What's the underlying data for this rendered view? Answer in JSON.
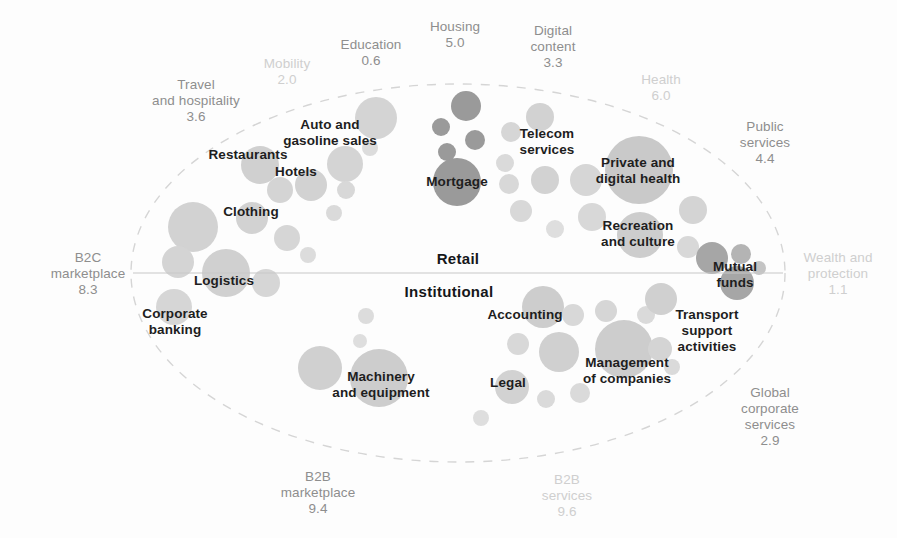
{
  "figure": {
    "type": "bubble-map",
    "background_color": "#fdfdfd",
    "divider_label_top": "Retail",
    "divider_label_bottom": "Institutional"
  },
  "axis_labels": {
    "retail": "Retail",
    "institutional": "Institutional"
  },
  "colors": {
    "bubble_light": "#d9d9d9",
    "bubble_mid": "#c9c9c9",
    "bubble_dark": "#9a9a9a",
    "outer_label": "#8e8e8e",
    "outer_label_faint": "#cfcfcf",
    "bubble_label": "#1e1e1e",
    "divider_line": "#c8c8c8",
    "ellipse_dash": "#d5d5d5"
  },
  "chart_data": {
    "type": "scatter",
    "title": "",
    "xlabel": "",
    "ylabel": "",
    "grid": false,
    "legend": "none",
    "divider": {
      "orientation": "horizontal",
      "y": 273,
      "x_start": 133,
      "x_end": 783,
      "above_label": "Retail",
      "below_label": "Institutional"
    },
    "boundary": {
      "shape": "ellipse",
      "cx": 458,
      "cy": 273,
      "rx": 327,
      "ry": 189,
      "style": "dashed"
    },
    "outer_labels": [
      {
        "name": "outer-label-mobility",
        "text": "Mobility",
        "value": "2.0",
        "x": 287,
        "y": 72,
        "faint": true
      },
      {
        "name": "outer-label-education",
        "text": "Education",
        "value": "0.6",
        "x": 371,
        "y": 53,
        "faint": false
      },
      {
        "name": "outer-label-housing",
        "text": "Housing",
        "value": "5.0",
        "x": 455,
        "y": 35,
        "faint": false
      },
      {
        "name": "outer-label-digital-content",
        "text": "Digital\ncontent",
        "value": "3.3",
        "x": 553,
        "y": 47,
        "faint": false
      },
      {
        "name": "outer-label-health",
        "text": "Health",
        "value": "6.0",
        "x": 661,
        "y": 88,
        "faint": true
      },
      {
        "name": "outer-label-public-services",
        "text": "Public\nservices",
        "value": "4.4",
        "x": 765,
        "y": 143,
        "faint": false
      },
      {
        "name": "outer-label-wealth-protection",
        "text": "Wealth and\nprotection",
        "value": "1.1",
        "x": 838,
        "y": 274,
        "faint": true
      },
      {
        "name": "outer-label-global-corporate",
        "text": "Global\ncorporate\nservices",
        "value": "2.9",
        "x": 770,
        "y": 417,
        "faint": false
      },
      {
        "name": "outer-label-b2b-services",
        "text": "B2B\nservices",
        "value": "9.6",
        "x": 567,
        "y": 496,
        "faint": true
      },
      {
        "name": "outer-label-b2b-marketplace",
        "text": "B2B\nmarketplace",
        "value": "9.4",
        "x": 318,
        "y": 493,
        "faint": false
      },
      {
        "name": "outer-label-b2c-marketplace",
        "text": "B2C\nmarketplace",
        "value": "8.3",
        "x": 88,
        "y": 274,
        "faint": false
      },
      {
        "name": "outer-label-travel-hospitality",
        "text": "Travel\nand hospitality",
        "value": "3.6",
        "x": 196,
        "y": 101,
        "faint": false
      }
    ],
    "bubble_labels": [
      {
        "name": "bubble-label-auto-gasoline",
        "text": "Auto and\ngasoline sales",
        "x": 330,
        "y": 133
      },
      {
        "name": "bubble-label-restaurants",
        "text": "Restaurants",
        "x": 248,
        "y": 155
      },
      {
        "name": "bubble-label-hotels",
        "text": "Hotels",
        "x": 296,
        "y": 172
      },
      {
        "name": "bubble-label-clothing",
        "text": "Clothing",
        "x": 251,
        "y": 212
      },
      {
        "name": "bubble-label-logistics",
        "text": "Logistics",
        "x": 224,
        "y": 281
      },
      {
        "name": "bubble-label-corporate-bank",
        "text": "Corporate\nbanking",
        "x": 175,
        "y": 322
      },
      {
        "name": "bubble-label-mortgage",
        "text": "Mortgage",
        "x": 457,
        "y": 182
      },
      {
        "name": "bubble-label-telecom",
        "text": "Telecom\nservices",
        "x": 547,
        "y": 142
      },
      {
        "name": "bubble-label-private-health",
        "text": "Private and\ndigital health",
        "x": 638,
        "y": 171
      },
      {
        "name": "bubble-label-recreation",
        "text": "Recreation\nand culture",
        "x": 638,
        "y": 234
      },
      {
        "name": "bubble-label-mutual-funds",
        "text": "Mutual\nfunds",
        "x": 735,
        "y": 275
      },
      {
        "name": "bubble-label-transport",
        "text": "Transport\nsupport\nactivities",
        "x": 707,
        "y": 331
      },
      {
        "name": "bubble-label-accounting",
        "text": "Accounting",
        "x": 525,
        "y": 315
      },
      {
        "name": "bubble-label-management",
        "text": "Management\nof companies",
        "x": 627,
        "y": 371
      },
      {
        "name": "bubble-label-legal",
        "text": "Legal",
        "x": 508,
        "y": 383
      },
      {
        "name": "bubble-label-machinery",
        "text": "Machinery\nand equipment",
        "x": 381,
        "y": 385
      }
    ],
    "bubbles": [
      {
        "x": 466,
        "y": 106,
        "r": 15,
        "c": "#9a9a9a"
      },
      {
        "x": 441,
        "y": 127,
        "r": 9,
        "c": "#9a9a9a"
      },
      {
        "x": 475,
        "y": 140,
        "r": 10,
        "c": "#9a9a9a"
      },
      {
        "x": 447,
        "y": 152,
        "r": 9,
        "c": "#9a9a9a"
      },
      {
        "x": 457,
        "y": 182,
        "r": 24,
        "c": "#9a9a9a"
      },
      {
        "x": 376,
        "y": 118,
        "r": 21,
        "c": "#d4d4d4"
      },
      {
        "x": 345,
        "y": 164,
        "r": 18,
        "c": "#d4d4d4"
      },
      {
        "x": 370,
        "y": 148,
        "r": 8,
        "c": "#dcdcdc"
      },
      {
        "x": 260,
        "y": 165,
        "r": 19,
        "c": "#d0d0d0"
      },
      {
        "x": 311,
        "y": 185,
        "r": 16,
        "c": "#d2d2d2"
      },
      {
        "x": 346,
        "y": 190,
        "r": 9,
        "c": "#d8d8d8"
      },
      {
        "x": 334,
        "y": 213,
        "r": 8,
        "c": "#dadada"
      },
      {
        "x": 280,
        "y": 190,
        "r": 13,
        "c": "#d4d4d4"
      },
      {
        "x": 252,
        "y": 218,
        "r": 16,
        "c": "#d2d2d2"
      },
      {
        "x": 287,
        "y": 238,
        "r": 13,
        "c": "#d6d6d6"
      },
      {
        "x": 308,
        "y": 255,
        "r": 8,
        "c": "#dcdcdc"
      },
      {
        "x": 193,
        "y": 227,
        "r": 25,
        "c": "#d2d2d2"
      },
      {
        "x": 178,
        "y": 262,
        "r": 16,
        "c": "#d4d4d4"
      },
      {
        "x": 226,
        "y": 273,
        "r": 24,
        "c": "#d0d0d0"
      },
      {
        "x": 266,
        "y": 283,
        "r": 14,
        "c": "#d6d6d6"
      },
      {
        "x": 174,
        "y": 307,
        "r": 18,
        "c": "#d6d6d6"
      },
      {
        "x": 540,
        "y": 117,
        "r": 14,
        "c": "#d2d2d2"
      },
      {
        "x": 511,
        "y": 132,
        "r": 10,
        "c": "#d6d6d6"
      },
      {
        "x": 505,
        "y": 163,
        "r": 9,
        "c": "#dadada"
      },
      {
        "x": 545,
        "y": 180,
        "r": 14,
        "c": "#d2d2d2"
      },
      {
        "x": 509,
        "y": 184,
        "r": 10,
        "c": "#d8d8d8"
      },
      {
        "x": 521,
        "y": 211,
        "r": 11,
        "c": "#d8d8d8"
      },
      {
        "x": 555,
        "y": 229,
        "r": 9,
        "c": "#dedede"
      },
      {
        "x": 639,
        "y": 170,
        "r": 34,
        "c": "#c9c9c9"
      },
      {
        "x": 586,
        "y": 180,
        "r": 16,
        "c": "#d6d6d6"
      },
      {
        "x": 592,
        "y": 217,
        "r": 14,
        "c": "#d8d8d8"
      },
      {
        "x": 640,
        "y": 235,
        "r": 23,
        "c": "#cdcdcd"
      },
      {
        "x": 693,
        "y": 210,
        "r": 14,
        "c": "#d4d4d4"
      },
      {
        "x": 688,
        "y": 247,
        "r": 11,
        "c": "#d8d8d8"
      },
      {
        "x": 712,
        "y": 258,
        "r": 16,
        "c": "#a6a6a6"
      },
      {
        "x": 741,
        "y": 254,
        "r": 10,
        "c": "#b4b4b4"
      },
      {
        "x": 759,
        "y": 268,
        "r": 7,
        "c": "#c4c4c4"
      },
      {
        "x": 737,
        "y": 283,
        "r": 17,
        "c": "#a6a6a6"
      },
      {
        "x": 543,
        "y": 307,
        "r": 21,
        "c": "#cdcdcd"
      },
      {
        "x": 573,
        "y": 315,
        "r": 11,
        "c": "#d8d8d8"
      },
      {
        "x": 518,
        "y": 344,
        "r": 11,
        "c": "#d8d8d8"
      },
      {
        "x": 559,
        "y": 352,
        "r": 20,
        "c": "#d0d0d0"
      },
      {
        "x": 624,
        "y": 349,
        "r": 29,
        "c": "#cdcdcd"
      },
      {
        "x": 606,
        "y": 311,
        "r": 11,
        "c": "#d6d6d6"
      },
      {
        "x": 646,
        "y": 315,
        "r": 9,
        "c": "#dadada"
      },
      {
        "x": 661,
        "y": 299,
        "r": 16,
        "c": "#d0d0d0"
      },
      {
        "x": 660,
        "y": 349,
        "r": 12,
        "c": "#d4d4d4"
      },
      {
        "x": 672,
        "y": 367,
        "r": 8,
        "c": "#dadada"
      },
      {
        "x": 512,
        "y": 387,
        "r": 17,
        "c": "#d2d2d2"
      },
      {
        "x": 546,
        "y": 399,
        "r": 9,
        "c": "#dadada"
      },
      {
        "x": 580,
        "y": 393,
        "r": 10,
        "c": "#dadada"
      },
      {
        "x": 481,
        "y": 418,
        "r": 8,
        "c": "#dedede"
      },
      {
        "x": 320,
        "y": 368,
        "r": 22,
        "c": "#d0d0d0"
      },
      {
        "x": 379,
        "y": 378,
        "r": 29,
        "c": "#cdcdcd"
      },
      {
        "x": 366,
        "y": 316,
        "r": 8,
        "c": "#dcdcdc"
      },
      {
        "x": 360,
        "y": 341,
        "r": 7,
        "c": "#dedede"
      }
    ]
  }
}
